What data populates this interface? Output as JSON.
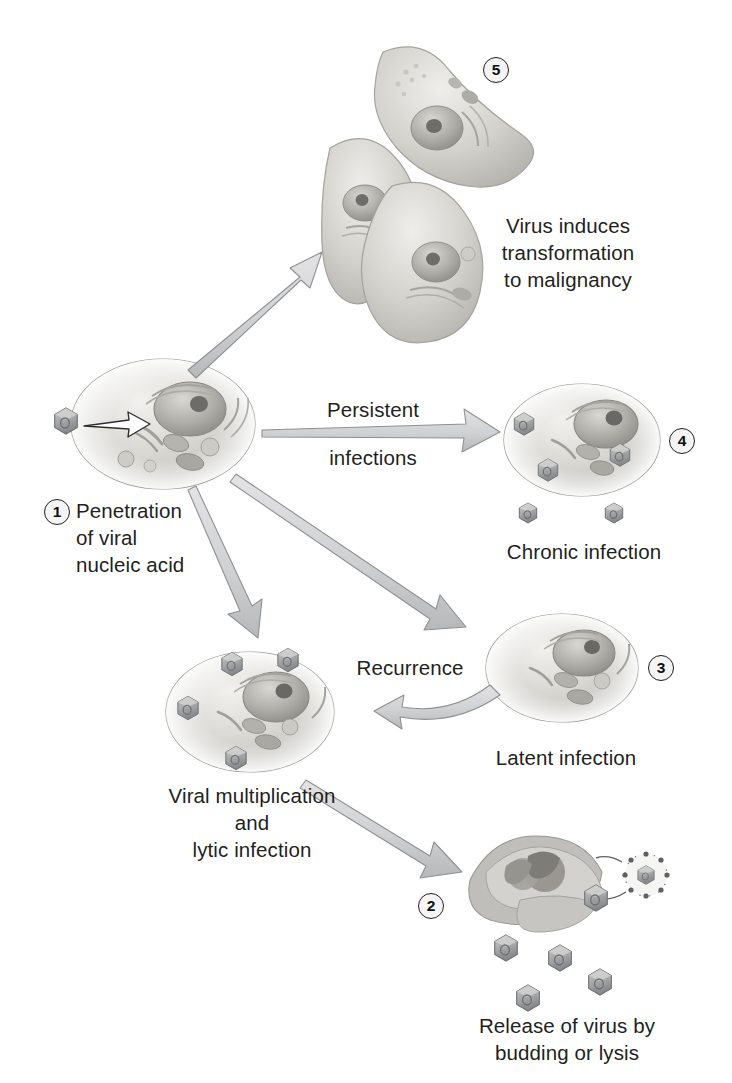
{
  "figure": {
    "background_color": "#ffffff",
    "ink_color": "#231f20",
    "arrow_fill": "#d2d3d5",
    "arrow_stroke": "#8b8d90",
    "cell_fill": "#cfcfcb",
    "virion_fill": "#a8a9ab"
  },
  "steps": [
    {
      "number": "1",
      "badge": "1",
      "label": "Penetration\nof viral\nnucleic acid",
      "role": "initial infected cell"
    },
    {
      "number": "2",
      "badge": "2",
      "label": "Release of virus by\nbudding or lysis",
      "role": "lysed cell releasing virions"
    },
    {
      "number": "3",
      "badge": "3",
      "label": "Latent infection",
      "role": "latent cell"
    },
    {
      "number": "4",
      "badge": "4",
      "label": "Chronic infection",
      "role": "chronically infected cell shedding virus"
    },
    {
      "number": "5",
      "badge": "5",
      "label": "Virus induces\ntransformation\nto malignancy",
      "role": "transformed malignant cells"
    }
  ],
  "pathway_labels": {
    "persistent_line1": "Persistent",
    "persistent_line2": "infections",
    "recurrence": "Recurrence"
  },
  "cell_labels": {
    "lytic": "Viral multiplication\nand\nlytic infection"
  },
  "icons": {
    "virion": "hexagonal-virus-particle",
    "enveloped_virion": "budding-enveloped-virion",
    "nucleus": "cell-nucleus",
    "mitochondrion": "mitochondrion",
    "er": "endoplasmic-reticulum"
  }
}
